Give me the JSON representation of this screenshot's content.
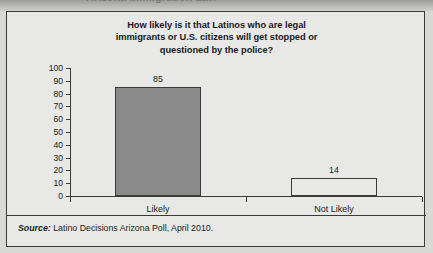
{
  "page": {
    "cut_off_header_text": "Arizona Immigration Law",
    "panel_background": "#e8e9e7",
    "border_color": "#3a3a38"
  },
  "source": {
    "label": "Source:",
    "text": "Latino Decisions Arizona Poll, April 2010."
  },
  "chart_data": {
    "type": "bar",
    "title": "How likely is it that Latinos who are legal immigrants or U.S. citizens will get stopped or questioned by the police?",
    "title_lines": [
      "How likely is it that Latinos who are legal",
      "immigrants or U.S. citizens will get stopped or",
      "questioned by the police?"
    ],
    "categories": [
      "Likely",
      "Not Likely"
    ],
    "values": [
      85,
      14
    ],
    "bar_styles": [
      "filled",
      "hollow"
    ],
    "bar_fill_colors": [
      "#8a8a8a",
      "#e8e9e7"
    ],
    "bar_outline_color": "#3a3a38",
    "xlabel": "",
    "ylabel": "",
    "ylim": [
      0,
      100
    ],
    "ytick_step": 10,
    "yticks": [
      0,
      10,
      20,
      30,
      40,
      50,
      60,
      70,
      80,
      90,
      100
    ],
    "ytick_labels": [
      "0",
      "10",
      "20",
      "30",
      "40",
      "50",
      "60",
      "70",
      "80",
      "90",
      "100"
    ],
    "grid": false,
    "legend": false
  }
}
